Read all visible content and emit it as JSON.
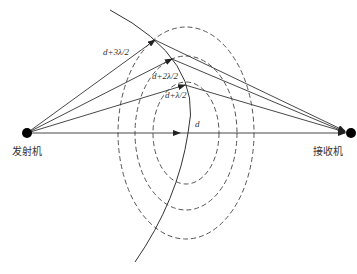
{
  "diagram": {
    "nodes": {
      "transmitter": {
        "label": "发射机",
        "x": 27,
        "y": 133
      },
      "receiver": {
        "label": "接收机",
        "x": 351,
        "y": 133
      }
    },
    "paths": [
      {
        "id": "direct",
        "label": "d",
        "via": null
      },
      {
        "id": "zone1",
        "label": "d+λ/2",
        "via": [
          185,
          85
        ]
      },
      {
        "id": "zone2",
        "label": "d+2λ/2",
        "via": [
          172,
          59
        ]
      },
      {
        "id": "zone3",
        "label": "d+3λ/2",
        "via": [
          155,
          40
        ]
      }
    ],
    "ellipses": [
      {
        "id": "zone1-ellipse",
        "cx": 186,
        "cy": 133,
        "rx": 33,
        "ry": 51
      },
      {
        "id": "zone2-ellipse",
        "cx": 186,
        "cy": 133,
        "rx": 51,
        "ry": 77
      },
      {
        "id": "zone3-ellipse",
        "cx": 186,
        "cy": 133,
        "rx": 68,
        "ry": 106
      }
    ],
    "colors": {
      "line": "#333333",
      "dashed": "#555555",
      "node": "#000000"
    }
  }
}
